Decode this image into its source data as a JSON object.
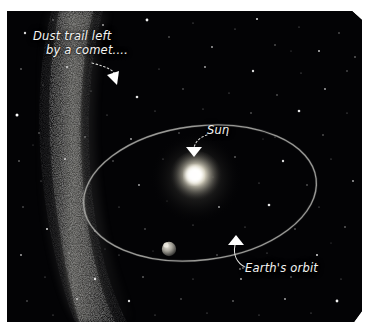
{
  "page": {
    "background_color": "#ffffff",
    "cutoff_text_top": "",
    "cutoff_text_top_right": ""
  },
  "illustration": {
    "name": "dust-trail-left-by-a-comet",
    "background_color": "#030305",
    "frame": {
      "left": 7,
      "top": 11,
      "width": 355,
      "height": 311
    },
    "annotations": [
      {
        "id": "dust-trail",
        "line1": "Dust trail left",
        "line2": "by a comet....",
        "text_color": "#f4f4f2",
        "leader": "curved dotted line to arrowhead",
        "arrow_tip": {
          "x": 104,
          "y": 68
        }
      },
      {
        "id": "sun",
        "line1": "Sun",
        "text_color": "#f4f4f2",
        "leader": "curved dotted line to arrowhead",
        "arrow_tip": {
          "x": 186,
          "y": 143
        }
      },
      {
        "id": "earths-orbit",
        "line1": "Earth's orbit",
        "text_color": "#f4f4f2",
        "leader": "curved dotted line to arrowhead",
        "arrow_tip": {
          "x": 228,
          "y": 228
        }
      }
    ],
    "objects": [
      {
        "id": "sun-body",
        "label": "Sun",
        "center": {
          "x": 189,
          "y": 167
        },
        "radius": 26,
        "core_color": "#ffffff",
        "glow_color": "#d9d4c4"
      },
      {
        "id": "earth-body",
        "label": "Earth",
        "center": {
          "x": 162,
          "y": 238
        },
        "radius": 7,
        "color": "#b9b6ae"
      },
      {
        "id": "earth-orbit-ellipse",
        "label": "Earth's orbit",
        "center": {
          "x": 193,
          "y": 182
        },
        "radius_x": 117,
        "radius_y": 67,
        "rotation_deg": -7,
        "stroke_color": "#9a9a96",
        "stroke_width": 1.3
      },
      {
        "id": "dust-trail-band",
        "label": "Dust trail left by a comet",
        "color": "#8e8d86",
        "description": "broad diffuse grainy band arcing from upper-left down the left side"
      }
    ],
    "starfield": {
      "star_color": "#ffffff",
      "description": "dense scattered white stars of varying size over black sky"
    }
  }
}
